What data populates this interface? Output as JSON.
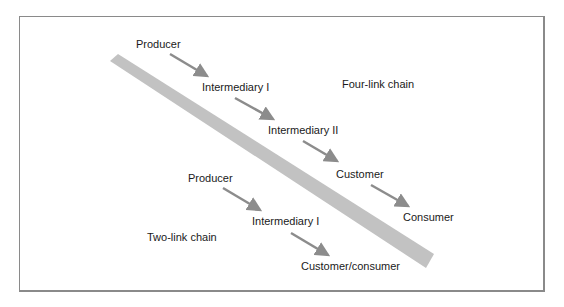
{
  "colors": {
    "band": "#c2c2c2",
    "arrow": "#8c8c8c",
    "border": "#8a8a8a",
    "text": "#1a1a1a"
  },
  "four_link_chain": {
    "title": "Four-link chain",
    "nodes": [
      "Producer",
      "Intermediary I",
      "Intermediary II",
      "Customer",
      "Consumer"
    ]
  },
  "two_link_chain": {
    "title": "Two-link chain",
    "nodes": [
      "Producer",
      "Intermediary I",
      "Customer/consumer"
    ]
  }
}
